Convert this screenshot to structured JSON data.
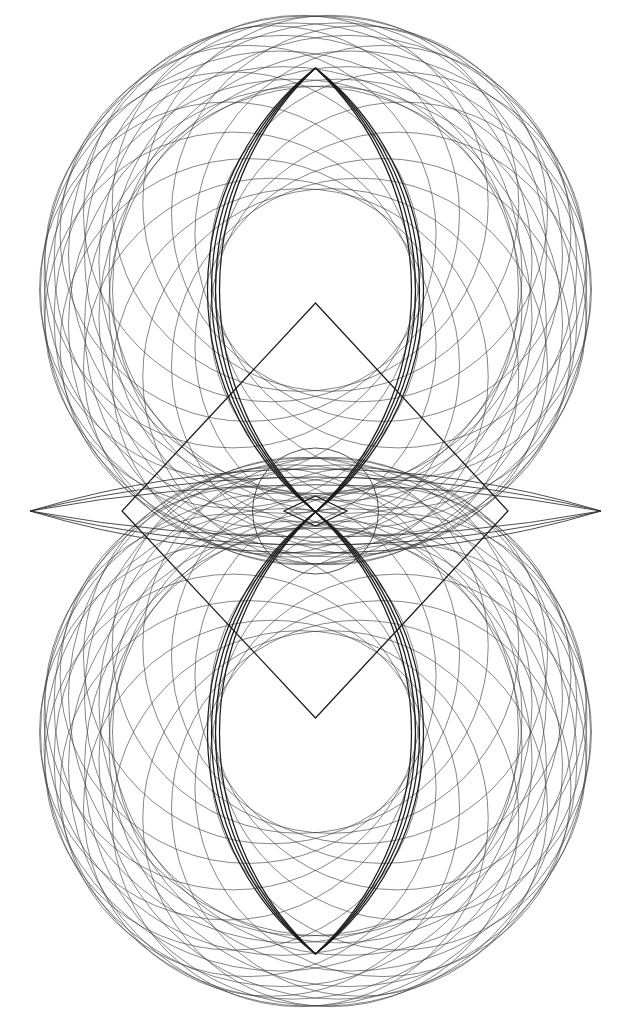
{
  "canvas": {
    "width": 631,
    "height": 1016,
    "background_color": "#ffffff",
    "title": "Geometric Rosette Composition"
  },
  "palette": {
    "ink_thin": "#3a3a3a",
    "ink_mid": "#2e2e2e",
    "ink_bold": "#1c1c1c",
    "ink_heavy": "#111111",
    "paper": "#ffffff"
  },
  "geometry": {
    "axis_x": 315.5,
    "axis_y": 511,
    "bounds": {
      "left": 38,
      "right": 593,
      "top": 64,
      "bottom": 958
    }
  },
  "chart_data": {
    "type": "scatter",
    "xlabel": "",
    "ylabel": "",
    "xlim": [
      0,
      631
    ],
    "ylim": [
      0,
      1016
    ],
    "grid": false,
    "legend": "none",
    "annotations": [
      "upper circle rosette",
      "lower circle rosette",
      "central small circle",
      "rotated square (diamond)",
      "upper vesica bundle",
      "lower vesica bundle",
      "horizontal lens wings",
      "central micro diamond"
    ],
    "series": [
      {
        "name": "upper-rosette-circles",
        "kind": "circle-family",
        "count": 18,
        "orbit_center": [
          315.5,
          290
        ],
        "orbit_radius": 88,
        "circle_radius": 188,
        "angle_start": 0,
        "angle_step": 20,
        "weight": "thin"
      },
      {
        "name": "lower-rosette-circles",
        "kind": "circle-family",
        "count": 18,
        "orbit_center": [
          315.5,
          732
        ],
        "orbit_radius": 88,
        "circle_radius": 188,
        "angle_start": 0,
        "angle_step": 20,
        "weight": "thin"
      },
      {
        "name": "upper-outer-ring",
        "kind": "circle-family",
        "count": 14,
        "orbit_center": [
          315.5,
          290
        ],
        "orbit_radius": 36,
        "circle_radius": 239,
        "angle_start": 0,
        "angle_step": 25.714,
        "weight": "thin"
      },
      {
        "name": "lower-outer-ring",
        "kind": "circle-family",
        "count": 14,
        "orbit_center": [
          315.5,
          732
        ],
        "orbit_radius": 36,
        "circle_radius": 239,
        "angle_start": 0,
        "angle_step": 25.714,
        "weight": "thin"
      },
      {
        "name": "upper-vesica-bundle",
        "kind": "vesica",
        "apex_top": [
          315.5,
          68
        ],
        "apex_bottom": [
          315.5,
          512
        ],
        "half_widths": [
          96,
          100,
          104,
          108
        ],
        "weight": "bold"
      },
      {
        "name": "lower-vesica-bundle",
        "kind": "vesica",
        "apex_top": [
          315.5,
          512
        ],
        "apex_bottom": [
          315.5,
          954
        ],
        "half_widths": [
          96,
          100,
          104,
          108
        ],
        "weight": "bold"
      },
      {
        "name": "central-circle",
        "kind": "circle",
        "center": [
          315.5,
          511
        ],
        "radius": 63,
        "weight": "mid"
      },
      {
        "name": "rotated-square",
        "kind": "polygon",
        "vertices": [
          [
            315.5,
            303
          ],
          [
            508,
            511
          ],
          [
            315.5,
            718
          ],
          [
            122,
            511
          ]
        ],
        "weight": "bold"
      },
      {
        "name": "horizontal-lens-wings",
        "kind": "lens",
        "apex_left": [
          30,
          511
        ],
        "apex_right": [
          601,
          511
        ],
        "half_heights": [
          26,
          34,
          42
        ],
        "weight": "mid"
      },
      {
        "name": "central-micro-diamond",
        "kind": "polygon",
        "vertices": [
          [
            315.5,
            496
          ],
          [
            347,
            511
          ],
          [
            315.5,
            526
          ],
          [
            284,
            511
          ]
        ],
        "weight": "bold"
      }
    ]
  },
  "layers": [
    {
      "id": "layer-upper-rosette",
      "label": "Upper Rosette"
    },
    {
      "id": "layer-lower-rosette",
      "label": "Lower Rosette"
    },
    {
      "id": "layer-vesicae",
      "label": "Vesica Bundles"
    },
    {
      "id": "layer-diamond",
      "label": "Rotated Square"
    },
    {
      "id": "layer-center",
      "label": "Central Circle"
    },
    {
      "id": "layer-wings",
      "label": "Horizontal Wings"
    }
  ]
}
